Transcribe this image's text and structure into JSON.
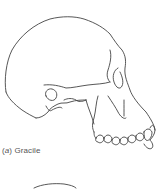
{
  "figure": {
    "panels": [
      {
        "id": "a",
        "caption_open": "(",
        "caption_letter": "a",
        "caption_close": ")",
        "caption_label": "Gracile",
        "subject": "gracile skull lateral view line drawing"
      },
      {
        "id": "b",
        "subject": "second skull (partially visible, cropped)"
      }
    ],
    "line_color": "#444444"
  }
}
